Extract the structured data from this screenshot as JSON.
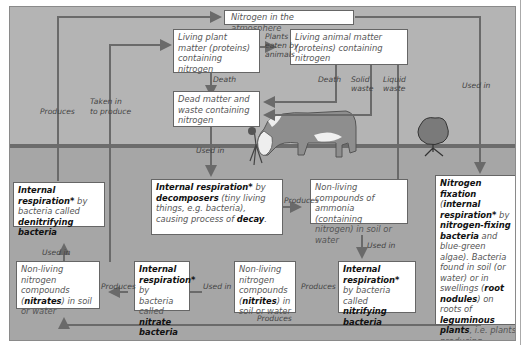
{
  "diagram": {
    "boxes": {
      "atmosphere": "Nitrogen in the atmosphere",
      "living_plant": "Living plant matter (proteins) containing nitrogen",
      "living_animal": "Living animal matter (proteins) containing nitrogen",
      "dead_matter": "Dead matter and waste containing nitrogen",
      "denitrifying": {
        "bold1": "Internal respiration*",
        "text1": " by bacteria called ",
        "bold2": "denitrifying bacteria"
      },
      "decomposers": {
        "bold1": "Internal respiration*",
        "text1": " by ",
        "bold2": "decomposers",
        "text2": " (tiny living things, e.g. bacteria), causing process of ",
        "bold3": "decay",
        "text3": "."
      },
      "ammonia": "Non-living compounds of ammonia (containing nitrogen) in soil or water",
      "fixation": {
        "bold1": "Nitrogen fixation",
        "text1": " (",
        "bold2": "internal respiration*",
        "text2": " by ",
        "bold3": "nitrogen-fixing bacteria",
        "text3": " and blue-green algae). Bacteria found in soil (or water) or in swellings (",
        "bold4": "root nodules",
        "text4": ") on roots of ",
        "bold5": "leguminous plants",
        "text5": ", i.e. plants producing ",
        "bold6": "legumes*",
        "text6": "."
      },
      "nitrates": {
        "text1": "Non-living nitrogen compounds (",
        "bold1": "nitrates",
        "text2": ") in soil or water"
      },
      "nitrate_bacteria": {
        "bold1": "Internal respiration*",
        "text1": " by bacteria called ",
        "bold2": "nitrate bacteria"
      },
      "nitrites": {
        "text1": "Non-living nitrogen compounds (",
        "bold1": "nitrites",
        "text2": ") in soil or water"
      },
      "nitrifying": {
        "bold1": "Internal respiration*",
        "text1": " by bacteria called ",
        "bold2": "nitrifying bacteria"
      }
    },
    "labels": {
      "produces_left": "Produces",
      "taken_in_1": "Taken in",
      "taken_in_2": "to produce",
      "plants_eaten_1": "Plants",
      "plants_eaten_2": "eaten by",
      "plants_eaten_3": "animals",
      "death_plant": "Death",
      "death_animal": "Death",
      "solid_1": "Solid",
      "solid_2": "waste",
      "liquid_1": "Liquid",
      "liquid_2": "waste",
      "used_in_right": "Used in",
      "used_in_dead": "Used in",
      "produces_ammonia": "Produces",
      "used_in_ammonia": "Used in",
      "used_in_nitrates": "Used in",
      "produces_nitrates": "Produces",
      "used_in_nitrites": "Used in",
      "produces_nitrites": "Produces",
      "produces_bottom": "Produces"
    }
  }
}
